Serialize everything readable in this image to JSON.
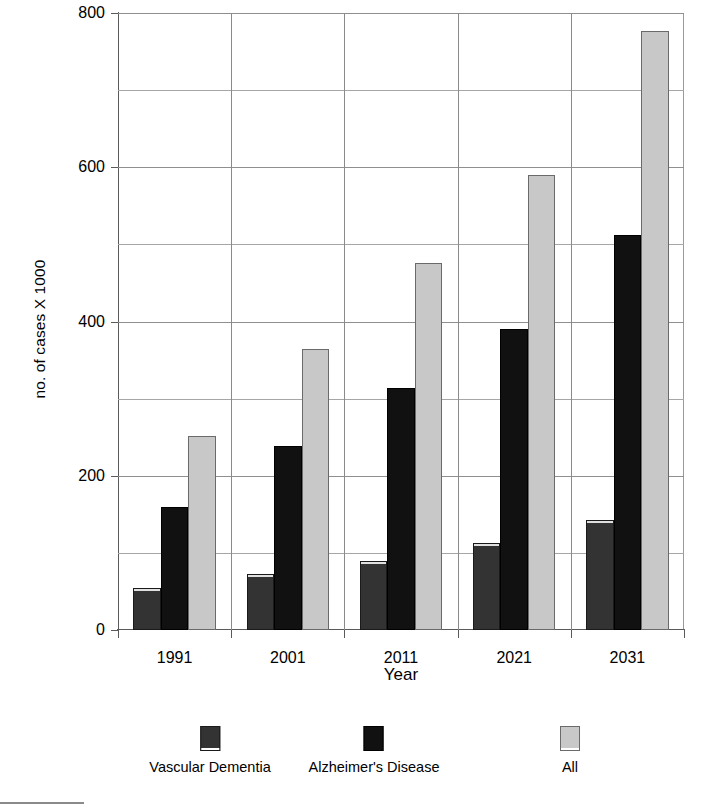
{
  "chart_data": {
    "type": "bar",
    "title": "",
    "xlabel": "Year",
    "ylabel": "no. of cases X 1000",
    "categories": [
      "1991",
      "2001",
      "2011",
      "2021",
      "2031"
    ],
    "series": [
      {
        "name": "Vascular Dementia",
        "color": "#333333",
        "values": [
          55,
          72,
          90,
          113,
          142
        ]
      },
      {
        "name": "Alzheimer's Disease",
        "color": "#111111",
        "values": [
          160,
          238,
          314,
          390,
          512
        ]
      },
      {
        "name": "All",
        "color": "#c8c8c8",
        "values": [
          252,
          364,
          476,
          590,
          777
        ]
      }
    ],
    "ylim": [
      0,
      800
    ],
    "ytick_labels": [
      "0",
      "200",
      "400",
      "600",
      "800"
    ],
    "ytick_values": [
      0,
      200,
      400,
      600,
      800
    ],
    "gridline_values": [
      100,
      200,
      300,
      400,
      500,
      600,
      700,
      800
    ],
    "grid": true,
    "legend_position": "bottom"
  },
  "axes": {
    "y_title": "no. of cases X 1000",
    "x_title": "Year"
  },
  "legend": {
    "items": [
      {
        "label": "Vascular Dementia",
        "swatch": "dark-gray-swatch"
      },
      {
        "label": "Alzheimer's Disease",
        "swatch": "black-swatch"
      },
      {
        "label": "All",
        "swatch": "light-gray-swatch"
      }
    ]
  },
  "colors": {
    "vascular_dementia": "#333333",
    "alzheimers_disease": "#111111",
    "all": "#c8c8c8",
    "grid": "#a6a6a6",
    "axis": "#5a5a5a",
    "background": "#ffffff"
  }
}
